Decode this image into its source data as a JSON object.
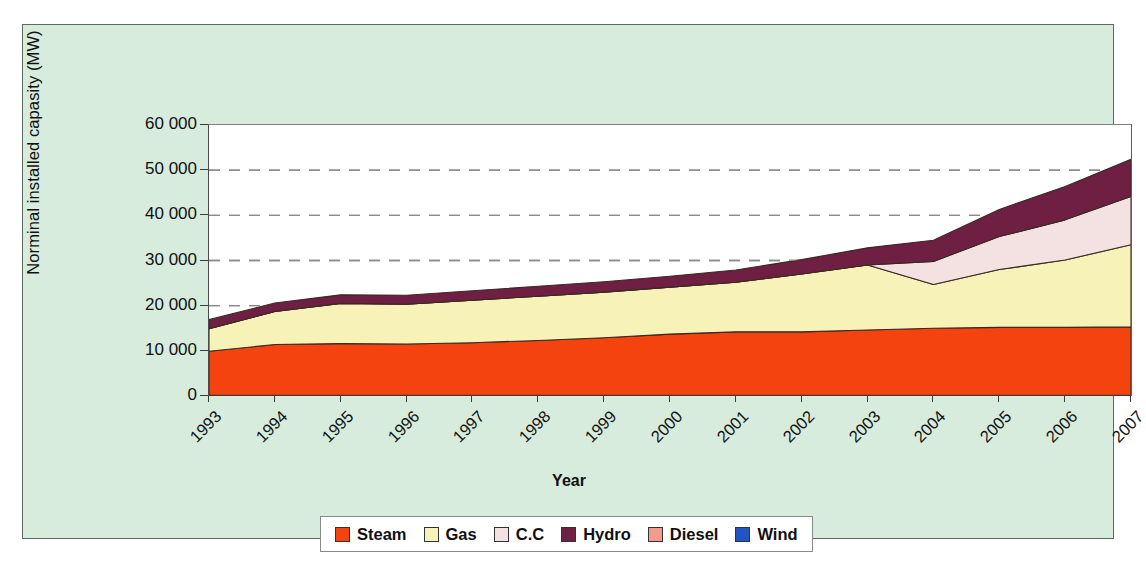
{
  "figure": {
    "background": "#d7ecdd",
    "plot_background": "#ffffff",
    "frame_color": "#5c6b63"
  },
  "axis": {
    "ytitle": "Norminal installed capasity (MW)",
    "xtitle": "Year",
    "yticks": [
      "0",
      "10 000",
      "20 000",
      "30 000",
      "40 000",
      "50 000",
      "60 000"
    ],
    "ytick_values": [
      0,
      10000,
      20000,
      30000,
      40000,
      50000,
      60000
    ]
  },
  "legend": {
    "items": [
      {
        "label": "Steam",
        "color": "#F4430F"
      },
      {
        "label": "Gas",
        "color": "#F7F2B8"
      },
      {
        "label": "C.C",
        "color": "#F4E2E2"
      },
      {
        "label": "Hydro",
        "color": "#6E1F42"
      },
      {
        "label": "Diesel",
        "color": "#F59A8E"
      },
      {
        "label": "Wind",
        "color": "#2255C4"
      }
    ]
  },
  "chart_data": {
    "type": "area",
    "stacked": true,
    "title": "",
    "xlabel": "Year",
    "ylabel": "Norminal installed capasity (MW)",
    "categories": [
      "1993",
      "1994",
      "1995",
      "1996",
      "1997",
      "1998",
      "1999",
      "2000",
      "2001",
      "2002",
      "2003",
      "2004",
      "2005",
      "2006",
      "2007"
    ],
    "ylim": [
      0,
      60000
    ],
    "ytick_step": 10000,
    "grid": "horizontal-dashed",
    "legend_position": "bottom",
    "series": [
      {
        "name": "Steam",
        "color": "#F4430F",
        "values": [
          9900,
          11400,
          11600,
          11500,
          11800,
          12300,
          12900,
          13700,
          14200,
          14200,
          14600,
          15000,
          15200,
          15200,
          15300
        ]
      },
      {
        "name": "Gas",
        "color": "#F7F2B8",
        "values": [
          5000,
          7300,
          8900,
          8800,
          9400,
          9800,
          10100,
          10400,
          11000,
          12800,
          14400,
          9700,
          12800,
          14900,
          18200
        ]
      },
      {
        "name": "C.C",
        "color": "#F4E2E2",
        "values": [
          0,
          0,
          0,
          0,
          0,
          0,
          0,
          0,
          0,
          0,
          0,
          5100,
          7300,
          8900,
          10700
        ]
      },
      {
        "name": "Hydro",
        "color": "#6E1F42",
        "values": [
          2000,
          1900,
          1900,
          2000,
          2100,
          2200,
          2300,
          2400,
          2700,
          3200,
          3800,
          4700,
          6000,
          7400,
          8200
        ]
      },
      {
        "name": "Diesel",
        "color": "#F59A8E",
        "values": [
          0,
          0,
          0,
          0,
          0,
          0,
          0,
          0,
          0,
          0,
          0,
          0,
          0,
          0,
          0
        ]
      },
      {
        "name": "Wind",
        "color": "#2255C4",
        "values": [
          0,
          0,
          0,
          0,
          0,
          0,
          0,
          0,
          0,
          0,
          0,
          0,
          0,
          0,
          0
        ]
      }
    ],
    "cumulative_tops": {
      "Steam": [
        9900,
        11400,
        11600,
        11500,
        11800,
        12300,
        12900,
        13700,
        14200,
        14200,
        14600,
        15000,
        15200,
        15200,
        15300
      ],
      "Gas": [
        14900,
        18700,
        20500,
        20300,
        21200,
        22100,
        23000,
        24100,
        25200,
        27000,
        29000,
        24700,
        28000,
        30100,
        33500
      ],
      "C.C": [
        14900,
        18700,
        20500,
        20300,
        21200,
        22100,
        23000,
        24100,
        25200,
        27000,
        29000,
        29800,
        35300,
        39000,
        44200
      ],
      "Hydro": [
        16900,
        20600,
        22400,
        22300,
        23300,
        24300,
        25300,
        26500,
        27900,
        30200,
        32800,
        34500,
        41300,
        46400,
        52400
      ]
    }
  }
}
